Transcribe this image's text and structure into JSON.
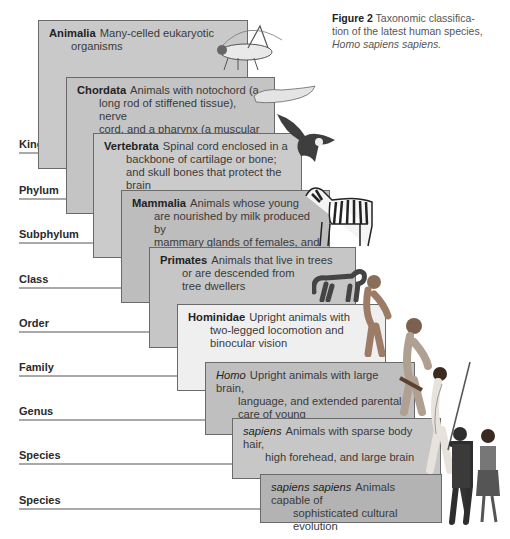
{
  "caption": {
    "label": "Figure 2",
    "text": "Taxonomic classifica-",
    "line2": "tion of the latest human species,",
    "line3": "Homo sapiens sapiens."
  },
  "ranks": [
    {
      "label": "Kingdom",
      "top": 152,
      "rule_width": 60
    },
    {
      "label": "Phylum",
      "top": 198,
      "rule_width": 88
    },
    {
      "label": "Subphylum",
      "top": 242,
      "rule_width": 115
    },
    {
      "label": "Class",
      "top": 287,
      "rule_width": 143
    },
    {
      "label": "Order",
      "top": 331,
      "rule_width": 172
    },
    {
      "label": "Family",
      "top": 375,
      "rule_width": 199
    },
    {
      "label": "Genus",
      "top": 419,
      "rule_width": 226
    },
    {
      "label": "Species",
      "top": 463,
      "rule_width": 253
    },
    {
      "label": "Species",
      "top": 508,
      "rule_width": 281
    }
  ],
  "taxa": [
    {
      "name": "Animalia",
      "style": "bold",
      "lines": [
        "Many-celled eukaryotic",
        "organisms"
      ],
      "color": "#c9c9c9"
    },
    {
      "name": "Chordata",
      "style": "bold",
      "lines": [
        "Animals with notochord (a",
        "long rod of stiffened tissue), nerve",
        "cord, and a pharynx (a muscular tube",
        "used in feeding, respiration, or both)"
      ],
      "color": "#c4c4c4"
    },
    {
      "name": "Vertebrata",
      "style": "bold",
      "lines": [
        "Spinal cord enclosed in a",
        "backbone of cartilage or bone;",
        "and skull bones that protect the brain"
      ],
      "color": "#cbcbcb"
    },
    {
      "name": "Mammalia",
      "style": "bold",
      "lines": [
        "Animals whose young",
        "are nourished by milk produced by",
        "mammary glands of females, and",
        "that have hair or fur and warm blood"
      ],
      "color": "#bdbdbd"
    },
    {
      "name": "Primates",
      "style": "bold",
      "lines": [
        "Animals that live in trees",
        "or are descended from",
        "tree dwellers"
      ],
      "color": "#c6c6c6"
    },
    {
      "name": "Hominidae",
      "style": "bold",
      "lines": [
        "Upright animals with",
        "two-legged locomotion and",
        "binocular vision"
      ],
      "color": "#efefef"
    },
    {
      "name": "Homo",
      "style": "italic",
      "lines": [
        "Upright animals with large brain,",
        "language, and extended parental",
        "care of young"
      ],
      "color": "#bfbfbf"
    },
    {
      "name": "sapiens",
      "style": "italic",
      "lines": [
        "Animals with sparse body hair,",
        "high forehead, and large brain"
      ],
      "color": "#c7c7c7"
    },
    {
      "name": "sapiens sapiens",
      "style": "italic",
      "lines": [
        "Animals capable of",
        "sophisticated cultural evolution"
      ],
      "color": "#b3b3b3"
    }
  ],
  "illustrations": [
    "grasshopper",
    "lancelet",
    "eagle",
    "zebra",
    "monkey",
    "early-hominid",
    "neanderthal",
    "early-human-with-spear",
    "modern-humans"
  ]
}
